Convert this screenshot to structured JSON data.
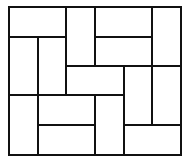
{
  "diagram": {
    "type": "tiling",
    "grid": {
      "cols": 6,
      "rows": 5,
      "x_lines": [
        9,
        38,
        66,
        95,
        124,
        152,
        181
      ],
      "y_lines": [
        7,
        37,
        66,
        95,
        125,
        155
      ]
    },
    "stroke_color": "#111111",
    "fill_color": "#ffffff",
    "stroke_width": 2,
    "tiles": [
      {
        "id": "t1",
        "orientation": "horizontal",
        "col": 0,
        "row": 0,
        "cols": 2,
        "rows": 1
      },
      {
        "id": "t2",
        "orientation": "vertical",
        "col": 2,
        "row": 0,
        "cols": 1,
        "rows": 2
      },
      {
        "id": "t3",
        "orientation": "horizontal",
        "col": 3,
        "row": 0,
        "cols": 2,
        "rows": 1
      },
      {
        "id": "t4",
        "orientation": "vertical",
        "col": 5,
        "row": 0,
        "cols": 1,
        "rows": 2
      },
      {
        "id": "t5",
        "orientation": "vertical",
        "col": 0,
        "row": 1,
        "cols": 1,
        "rows": 2
      },
      {
        "id": "t6",
        "orientation": "vertical",
        "col": 1,
        "row": 1,
        "cols": 1,
        "rows": 2
      },
      {
        "id": "t7",
        "orientation": "horizontal",
        "col": 3,
        "row": 1,
        "cols": 2,
        "rows": 1
      },
      {
        "id": "t8",
        "orientation": "horizontal",
        "col": 2,
        "row": 2,
        "cols": 2,
        "rows": 1
      },
      {
        "id": "t9",
        "orientation": "vertical",
        "col": 4,
        "row": 2,
        "cols": 1,
        "rows": 2
      },
      {
        "id": "t10",
        "orientation": "vertical",
        "col": 5,
        "row": 2,
        "cols": 1,
        "rows": 2
      },
      {
        "id": "t11",
        "orientation": "vertical",
        "col": 0,
        "row": 3,
        "cols": 1,
        "rows": 2
      },
      {
        "id": "t12",
        "orientation": "horizontal",
        "col": 1,
        "row": 3,
        "cols": 2,
        "rows": 1
      },
      {
        "id": "t13",
        "orientation": "vertical",
        "col": 3,
        "row": 3,
        "cols": 1,
        "rows": 2
      },
      {
        "id": "t14",
        "orientation": "horizontal",
        "col": 1,
        "row": 4,
        "cols": 2,
        "rows": 1
      },
      {
        "id": "t15",
        "orientation": "horizontal",
        "col": 4,
        "row": 4,
        "cols": 2,
        "rows": 1
      }
    ]
  }
}
